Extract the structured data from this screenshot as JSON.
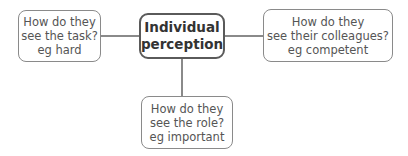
{
  "diagram": {
    "center": {
      "lines": [
        "Individual",
        "perception"
      ]
    },
    "nodes": [
      {
        "id": "task",
        "lines": [
          "How do they",
          "see the task?",
          "eg hard"
        ]
      },
      {
        "id": "colleagues",
        "lines": [
          "How do they",
          "see their colleagues?",
          "eg competent"
        ]
      },
      {
        "id": "role",
        "lines": [
          "How do they",
          "see the role?",
          "eg important"
        ]
      }
    ],
    "colors": {
      "border": "#8a8a8a",
      "center_border": "#5a5a5a",
      "text": "#555555",
      "center_text": "#333333"
    }
  }
}
